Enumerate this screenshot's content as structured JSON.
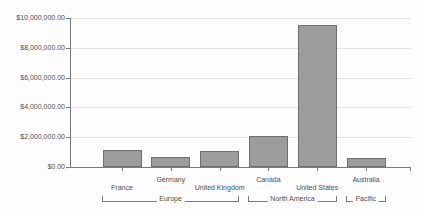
{
  "chart_data": {
    "type": "bar",
    "title": "",
    "xlabel": "",
    "ylabel": "",
    "categories": [
      "France",
      "Germany",
      "United Kingdom",
      "Canada",
      "United States",
      "Australia"
    ],
    "values": [
      1150000,
      700000,
      1100000,
      2100000,
      9500000,
      620000
    ],
    "category_groups": [
      {
        "label": "Europe",
        "from": 0,
        "to": 2
      },
      {
        "label": "North America",
        "from": 3,
        "to": 4
      },
      {
        "label": "Pacific",
        "from": 5,
        "to": 5
      }
    ],
    "y_axis": {
      "min": 0,
      "max": 10000000,
      "step": 2000000,
      "tick_labels": [
        "$0.00",
        "$2,000,000.00",
        "$4,000,000.00",
        "$6,000,000.00",
        "$8,000,000.00",
        "$10,000,000.00"
      ]
    },
    "grid": true,
    "legend": false,
    "colors": {
      "bar_fill": "#9c9c9c",
      "bar_border": "#6f6f6f",
      "axis": "#7a7a7a",
      "gridline": "#e3e3e3",
      "text": "#4d4d4d",
      "background": "#fdfdfd"
    }
  }
}
